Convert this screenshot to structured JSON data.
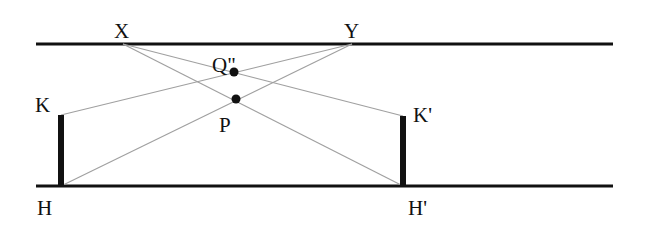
{
  "diagram": {
    "labels": {
      "X": "X",
      "Y": "Y",
      "Q": "Q\"",
      "P": "P",
      "K": "K",
      "K_prime": "K'",
      "H": "H",
      "H_prime": "H'"
    },
    "colors": {
      "thick_line": "#111111",
      "thin_line": "#a0a0a0",
      "dot": "#111111"
    }
  }
}
